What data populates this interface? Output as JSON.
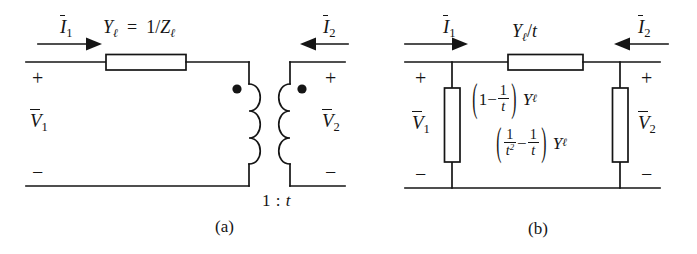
{
  "figure": {
    "background": "#ffffff",
    "ink": "#151515"
  },
  "panel_a": {
    "caption": "(a)",
    "current_in_label": {
      "symbol": "I",
      "subscript": "1",
      "overbar": true
    },
    "current_out_label": {
      "symbol": "I",
      "subscript": "2",
      "overbar": true
    },
    "voltage_left_label": {
      "symbol": "V",
      "subscript": "1",
      "overbar": true
    },
    "voltage_right_label": {
      "symbol": "V",
      "subscript": "2",
      "overbar": true
    },
    "series_element_label": "Y_ell = 1/Z_ell",
    "series_element_parts": {
      "Y": "Y",
      "ell": "ℓ",
      "equals": "=",
      "one_over": "1/",
      "Z": "Z"
    },
    "polarity_left_plus": "+",
    "polarity_left_minus": "−",
    "polarity_right_plus": "+",
    "polarity_right_minus": "−",
    "turns_ratio": "1 : t",
    "turns_ratio_parts": {
      "one": "1",
      "colon": ":",
      "t": "t"
    },
    "transformer": {
      "primary_dot": "dot-marker",
      "secondary_dot": "dot-marker",
      "coil_loops": 3
    }
  },
  "panel_b": {
    "caption": "(b)",
    "current_in_label": {
      "symbol": "I",
      "subscript": "1",
      "overbar": true
    },
    "current_out_label": {
      "symbol": "I",
      "subscript": "2",
      "overbar": true
    },
    "voltage_left_label": {
      "symbol": "V",
      "subscript": "1",
      "overbar": true
    },
    "voltage_right_label": {
      "symbol": "V",
      "subscript": "2",
      "overbar": true
    },
    "series_element_label": "Y_ell / t",
    "shunt_left_label": "(1 - 1/t) Y_ell",
    "shunt_right_label": "(1/t^2 - 1/t) Y_ell",
    "polarity_left_plus": "+",
    "polarity_left_minus": "−",
    "polarity_right_plus": "+",
    "polarity_right_minus": "−",
    "symbols": {
      "Y": "Y",
      "ell": "ℓ",
      "t": "t",
      "one": "1",
      "minus": "−",
      "slash": "/",
      "lparen": "(",
      "rparen": ")",
      "two": "2"
    }
  }
}
